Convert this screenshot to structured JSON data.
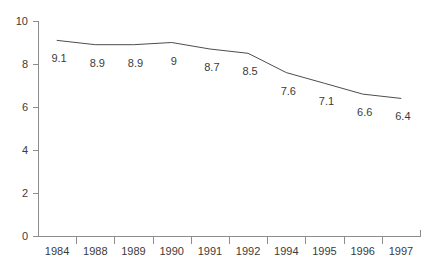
{
  "chart_data": {
    "type": "line",
    "title": "",
    "subtitle": "",
    "xlabel": "",
    "ylabel": "",
    "categories": [
      "1984",
      "1988",
      "1989",
      "1990",
      "1991",
      "1992",
      "1994",
      "1995",
      "1996",
      "1997"
    ],
    "values": [
      9.1,
      8.9,
      8.9,
      9,
      8.7,
      8.5,
      7.6,
      7.1,
      6.6,
      6.4
    ],
    "point_labels": [
      "9.1",
      "8.9",
      "8.9",
      "9",
      "8.7",
      "8.5",
      "7.6",
      "7.1",
      "6.6",
      "6.4"
    ],
    "ylim": [
      0,
      10
    ],
    "yticks": [
      0,
      2,
      4,
      6,
      8,
      10
    ],
    "ytick_labels": [
      "0",
      "2",
      "4",
      "6",
      "8",
      "10"
    ],
    "grid": false,
    "legend": false,
    "legend_position": "none",
    "series": [
      {
        "name": "",
        "values": [
          9.1,
          8.9,
          8.9,
          9,
          8.7,
          8.5,
          7.6,
          7.1,
          6.6,
          6.4
        ]
      }
    ],
    "colors": {
      "line": "#4d4d4d",
      "axis": "#8c8c8c",
      "text": "#3b3b3b",
      "background": "#ffffff"
    }
  },
  "layout": {
    "plot_left": 38,
    "plot_right": 420,
    "plot_top": 21,
    "plot_bottom": 236
  }
}
